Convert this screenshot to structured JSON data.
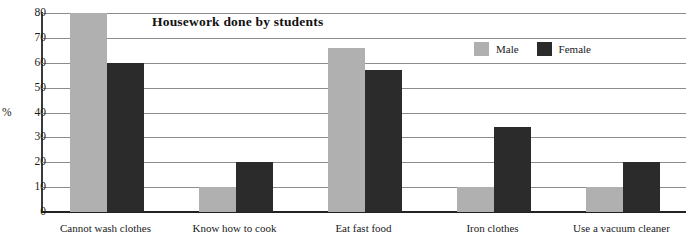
{
  "chart_data": {
    "type": "bar",
    "title": "Housework done by students",
    "xlabel": "",
    "ylabel": "%",
    "ylim": [
      0,
      80
    ],
    "ytick_step": 10,
    "yticks": [
      "80",
      "70",
      "60",
      "50",
      "40",
      "30",
      "20",
      "10",
      "0"
    ],
    "grid": true,
    "legend_position": "top-right",
    "categories": [
      "Cannot wash clothes",
      "Know how to cook",
      "Eat fast food",
      "Iron clothes",
      "Use a vacuum cleaner"
    ],
    "series": [
      {
        "name": "Male",
        "color": "#b0b0b0",
        "values": [
          80,
          10,
          66,
          10,
          10
        ]
      },
      {
        "name": "Female",
        "color": "#2b2b2b",
        "values": [
          60,
          20,
          57,
          34,
          20
        ]
      }
    ]
  },
  "colors": {
    "male": "#b0b0b0",
    "female": "#2b2b2b",
    "gridline": "#8c8c8c",
    "axis": "#3a3a3a",
    "baseline": "#222222",
    "text": "#1a1a1a",
    "background": "#ffffff"
  }
}
